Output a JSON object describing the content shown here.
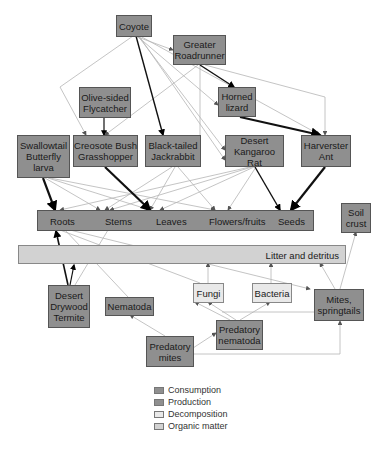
{
  "colors": {
    "consumption": "#8f8f8f",
    "production": "#8f8f8f",
    "decomposition": "#e9e9e9",
    "organic_matter": "#d2d2d2"
  },
  "nodes": {
    "coyote": "Coyote",
    "roadrunner": "Greater\nRoadrunner",
    "flycatcher": "Olive-sided\nFlycatcher",
    "horned_lizard": "Horned\nlizard",
    "swallowtail": "Swallowtail\nButterfly\nlarva",
    "grasshopper": "Creosote Bush\nGrasshopper",
    "jackrabbit": "Black-tailed\nJackrabbit",
    "kangaroo_rat": "Desert\nKangaroo Rat",
    "harvester_ant": "Harverster\nAnt",
    "soil_crust": "Soil\ncrust",
    "termite": "Desert\nDrywood\nTermite",
    "nematoda": "Nematoda",
    "fungi": "Fungi",
    "bacteria": "Bacteria",
    "mites_springtails": "Mites,\nspringtails",
    "predatory_nematoda": "Predatory\nnematoda",
    "predatory_mites": "Predatory\nmites"
  },
  "plant_bar": {
    "roots": "Roots",
    "stems": "Stems",
    "leaves": "Leaves",
    "flowers": "Flowers/fruits",
    "seeds": "Seeds"
  },
  "litter_bar": {
    "label": "Litter and detritus"
  },
  "legend": [
    {
      "label": "Consumption",
      "color": "#8f8f8f"
    },
    {
      "label": "Production",
      "color": "#8f8f8f"
    },
    {
      "label": "Decomposition",
      "color": "#e9e9e9"
    },
    {
      "label": "Organic matter",
      "color": "#d2d2d2"
    }
  ]
}
